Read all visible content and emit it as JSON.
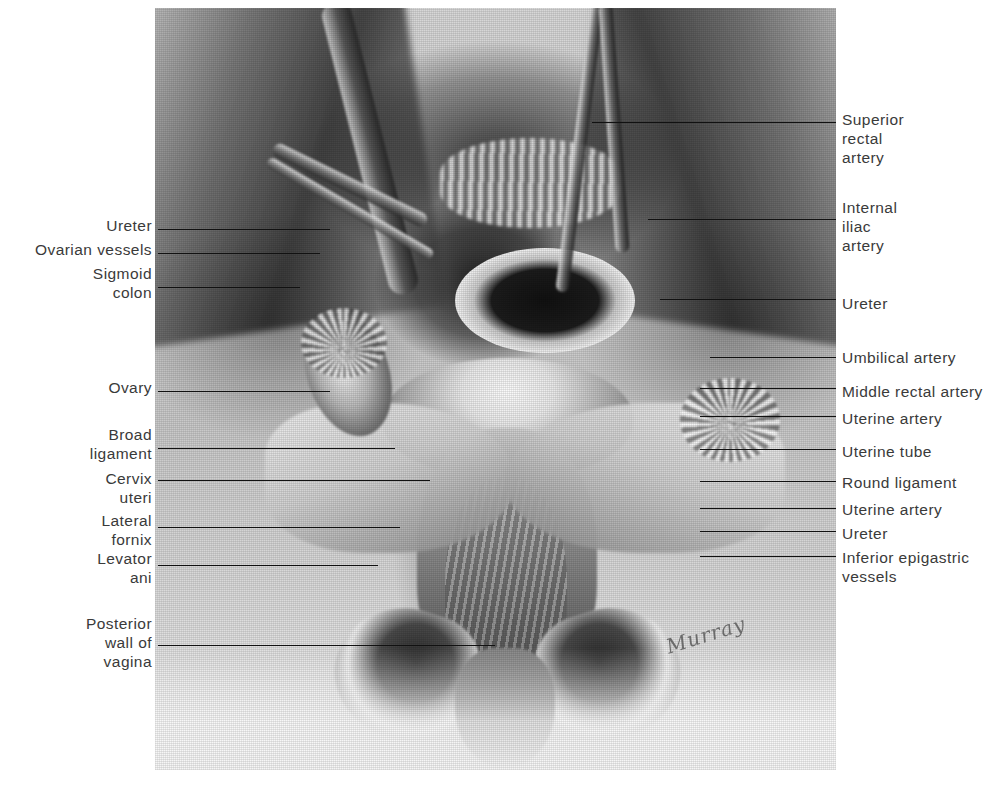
{
  "figure": {
    "signature": "Murray",
    "panel": {
      "x": 155,
      "y": 8,
      "width": 681,
      "height": 762
    }
  },
  "labels_left": [
    {
      "name": "ureter",
      "text": "Ureter",
      "text_right": 152,
      "text_top": 216,
      "line_y": 229,
      "line_x1": 158,
      "line_x2": 330
    },
    {
      "name": "ovarian-vessels",
      "text": "Ovarian vessels",
      "text_right": 152,
      "text_top": 240,
      "line_y": 253,
      "line_x1": 158,
      "line_x2": 320
    },
    {
      "name": "sigmoid-colon",
      "text": "Sigmoid\ncolon",
      "text_right": 152,
      "text_top": 264,
      "line_y": 287,
      "line_x1": 158,
      "line_x2": 300
    },
    {
      "name": "ovary",
      "text": "Ovary",
      "text_right": 152,
      "text_top": 378,
      "line_y": 391,
      "line_x1": 158,
      "line_x2": 330
    },
    {
      "name": "broad-ligament",
      "text": "Broad\nligament",
      "text_right": 152,
      "text_top": 425,
      "line_y": 448,
      "line_x1": 158,
      "line_x2": 395
    },
    {
      "name": "cervix-uteri",
      "text": "Cervix\nuteri",
      "text_right": 152,
      "text_top": 469,
      "line_y": 480,
      "line_x1": 158,
      "line_x2": 430
    },
    {
      "name": "lateral-fornix",
      "text": "Lateral\nfornix",
      "text_right": 152,
      "text_top": 511,
      "line_y": 527,
      "line_x1": 158,
      "line_x2": 400
    },
    {
      "name": "levator-ani",
      "text": "Levator\nani",
      "text_right": 152,
      "text_top": 549,
      "line_y": 565,
      "line_x1": 158,
      "line_x2": 378
    },
    {
      "name": "posterior-wall-of-vagina",
      "text": "Posterior\nwall of\nvagina",
      "text_right": 152,
      "text_top": 614,
      "line_y": 645,
      "line_x1": 158,
      "line_x2": 495
    }
  ],
  "labels_right": [
    {
      "name": "superior-rectal-artery",
      "text": "Superior\nrectal\nartery",
      "text_left": 842,
      "text_top": 110,
      "line_y": 122,
      "line_x1": 592,
      "line_x2": 836
    },
    {
      "name": "internal-iliac-artery",
      "text": "Internal\niliac\nartery",
      "text_left": 842,
      "text_top": 198,
      "line_y": 219,
      "line_x1": 648,
      "line_x2": 836
    },
    {
      "name": "ureter-right",
      "text": "Ureter",
      "text_left": 842,
      "text_top": 294,
      "line_y": 299,
      "line_x1": 660,
      "line_x2": 836
    },
    {
      "name": "umbilical-artery",
      "text": "Umbilical artery",
      "text_left": 842,
      "text_top": 348,
      "line_y": 357,
      "line_x1": 710,
      "line_x2": 836
    },
    {
      "name": "middle-rectal-artery",
      "text": "Middle rectal artery",
      "text_left": 842,
      "text_top": 382,
      "line_y": 388,
      "line_x1": 700,
      "line_x2": 836
    },
    {
      "name": "uterine-artery-upper",
      "text": "Uterine artery",
      "text_left": 842,
      "text_top": 409,
      "line_y": 416,
      "line_x1": 700,
      "line_x2": 836
    },
    {
      "name": "uterine-tube",
      "text": "Uterine tube",
      "text_left": 842,
      "text_top": 442,
      "line_y": 449,
      "line_x1": 700,
      "line_x2": 836
    },
    {
      "name": "round-ligament",
      "text": "Round ligament",
      "text_left": 842,
      "text_top": 473,
      "line_y": 481,
      "line_x1": 700,
      "line_x2": 836
    },
    {
      "name": "uterine-artery-lower",
      "text": "Uterine artery",
      "text_left": 842,
      "text_top": 500,
      "line_y": 508,
      "line_x1": 700,
      "line_x2": 836
    },
    {
      "name": "ureter-lower-right",
      "text": "Ureter",
      "text_left": 842,
      "text_top": 524,
      "line_y": 531,
      "line_x1": 700,
      "line_x2": 836
    },
    {
      "name": "inferior-epigastric-vessels",
      "text": "Inferior epigastric\nvessels",
      "text_left": 842,
      "text_top": 548,
      "line_y": 556,
      "line_x1": 700,
      "line_x2": 836
    }
  ],
  "colors": {
    "label_text": "#3a3a3a",
    "leader_line": "#111111",
    "page_background": "#ffffff",
    "plate_light": "#e2e2e2",
    "plate_mid": "#9a9a9a",
    "plate_dark": "#1a1a1a"
  }
}
